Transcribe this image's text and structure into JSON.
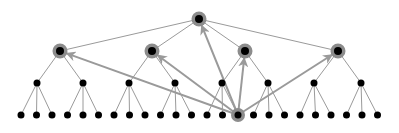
{
  "diagram": {
    "type": "tree",
    "colors": {
      "node": "#000000",
      "halo": "#8c8c8c",
      "edge": "#9a9a9a",
      "arrow": "#9a9a9a",
      "background": "#ffffff"
    },
    "root": {
      "x": 199,
      "y": 19,
      "highlighted": true
    },
    "level1": [
      {
        "x": 60,
        "y": 51,
        "highlighted": true
      },
      {
        "x": 152,
        "y": 51,
        "highlighted": true
      },
      {
        "x": 245,
        "y": 51,
        "highlighted": true
      },
      {
        "x": 338,
        "y": 51,
        "highlighted": true
      }
    ],
    "level2_y": 83,
    "level2_x": [
      37,
      83,
      129,
      175,
      222,
      268,
      314,
      361
    ],
    "leaf_y": 115,
    "leaf_start_x": 21,
    "leaf_spacing": 15.5,
    "leaf_count": 24,
    "highlighted_leaf_index": 14,
    "arrows_from_leaf_to": [
      "root",
      "level1.0",
      "level1.1",
      "level1.2",
      "level1.3"
    ]
  }
}
